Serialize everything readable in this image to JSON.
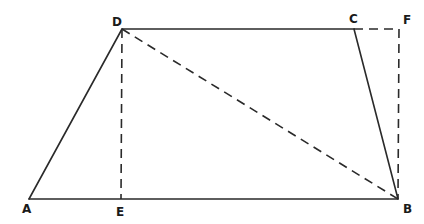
{
  "figure": {
    "type": "trapezoid geometry diagram",
    "background": "#ffffff",
    "stroke_color": "#2a2a2a",
    "points": {
      "A": {
        "x": 29,
        "y": 199,
        "label": "A",
        "label_x": 22,
        "label_y": 213
      },
      "B": {
        "x": 398,
        "y": 199,
        "label": "B",
        "label_x": 403,
        "label_y": 213
      },
      "C": {
        "x": 354,
        "y": 29,
        "label": "C",
        "label_x": 349,
        "label_y": 23
      },
      "D": {
        "x": 122,
        "y": 29,
        "label": "D",
        "label_x": 112,
        "label_y": 26
      },
      "E": {
        "x": 121,
        "y": 199,
        "label": "E",
        "label_x": 116,
        "label_y": 216
      },
      "F": {
        "x": 399,
        "y": 29,
        "label": "F",
        "label_x": 403,
        "label_y": 24
      }
    },
    "segments": [
      {
        "from": "A",
        "to": "B",
        "style": "solid"
      },
      {
        "from": "B",
        "to": "C",
        "style": "solid"
      },
      {
        "from": "C",
        "to": "D",
        "style": "solid"
      },
      {
        "from": "D",
        "to": "A",
        "style": "solid"
      },
      {
        "from": "D",
        "to": "B",
        "style": "dashed"
      },
      {
        "from": "D",
        "to": "E",
        "style": "dashed"
      },
      {
        "from": "C",
        "to": "F",
        "style": "dashed"
      },
      {
        "from": "F",
        "to": "B",
        "style": "dashed"
      }
    ]
  }
}
